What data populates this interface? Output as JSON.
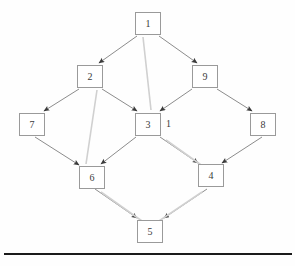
{
  "diagram": {
    "background_color": "#fefefe",
    "edge_color": "#8c8c8c",
    "edge_shadow_color": "#d0d0d0",
    "arrow_color": "#3a3a3a",
    "node_border_color": "#9a9a9a",
    "node_fill_color": "#ffffff",
    "text_color": "#3a3a3a",
    "rule_color": "#1a1a1a",
    "nodes": [
      {
        "id": "n1",
        "label": "1",
        "x": 135,
        "y": 12,
        "w": 26,
        "h": 23
      },
      {
        "id": "n2",
        "label": "2",
        "x": 77,
        "y": 65,
        "w": 26,
        "h": 23
      },
      {
        "id": "n9",
        "label": "9",
        "x": 192,
        "y": 65,
        "w": 26,
        "h": 23
      },
      {
        "id": "n7",
        "label": "7",
        "x": 19,
        "y": 113,
        "w": 26,
        "h": 23
      },
      {
        "id": "n3",
        "label": "3",
        "x": 135,
        "y": 113,
        "w": 26,
        "h": 23
      },
      {
        "id": "n8",
        "label": "8",
        "x": 250,
        "y": 113,
        "w": 26,
        "h": 23
      },
      {
        "id": "n6",
        "label": "6",
        "x": 79,
        "y": 166,
        "w": 26,
        "h": 23
      },
      {
        "id": "n4",
        "label": "4",
        "x": 198,
        "y": 164,
        "w": 26,
        "h": 23
      },
      {
        "id": "n5",
        "label": "5",
        "x": 137,
        "y": 220,
        "w": 26,
        "h": 23
      }
    ],
    "edge_labels": [
      {
        "id": "lbl-3-right",
        "text": "1",
        "x": 166,
        "y": 119
      }
    ],
    "edges": [
      {
        "id": "e-1-2",
        "from": "1",
        "to": "2",
        "x1": 137,
        "y1": 36,
        "x2": 99,
        "y2": 63,
        "arrow": true
      },
      {
        "id": "e-1-9",
        "from": "1",
        "to": "9",
        "x1": 159,
        "y1": 36,
        "x2": 197,
        "y2": 63,
        "arrow": true
      },
      {
        "id": "e-1-3",
        "from": "1",
        "to": "3",
        "x1": 143,
        "y1": 37,
        "x2": 151,
        "y2": 110,
        "arrow": false,
        "style": "shadow"
      },
      {
        "id": "e-2-7",
        "from": "2",
        "to": "7",
        "x1": 79,
        "y1": 89,
        "x2": 44,
        "y2": 111,
        "arrow": true
      },
      {
        "id": "e-2-3",
        "from": "2",
        "to": "3",
        "x1": 102,
        "y1": 89,
        "x2": 137,
        "y2": 111,
        "arrow": true
      },
      {
        "id": "e-2-6",
        "from": "2",
        "to": "6",
        "x1": 97,
        "y1": 90,
        "x2": 86,
        "y2": 164,
        "arrow": false,
        "style": "shadow"
      },
      {
        "id": "e-9-3",
        "from": "9",
        "to": "3",
        "x1": 192,
        "y1": 89,
        "x2": 160,
        "y2": 111,
        "arrow": true
      },
      {
        "id": "e-9-8",
        "from": "9",
        "to": "8",
        "x1": 217,
        "y1": 89,
        "x2": 252,
        "y2": 111,
        "arrow": true
      },
      {
        "id": "e-7-6",
        "from": "7",
        "to": "6",
        "x1": 35,
        "y1": 137,
        "x2": 79,
        "y2": 165,
        "arrow": true
      },
      {
        "id": "e-3-6",
        "from": "3",
        "to": "6",
        "x1": 136,
        "y1": 137,
        "x2": 101,
        "y2": 164,
        "arrow": true
      },
      {
        "id": "e-3-4",
        "from": "3",
        "to": "4",
        "x1": 160,
        "y1": 137,
        "x2": 198,
        "y2": 163,
        "arrow": true
      },
      {
        "id": "e-3-4-shadow",
        "from": "3",
        "to": "4",
        "x1": 166,
        "y1": 140,
        "x2": 204,
        "y2": 167,
        "arrow": false,
        "style": "shadow"
      },
      {
        "id": "e-8-4",
        "from": "8",
        "to": "4",
        "x1": 262,
        "y1": 137,
        "x2": 222,
        "y2": 163,
        "arrow": true
      },
      {
        "id": "e-6-5",
        "from": "6",
        "to": "5",
        "x1": 95,
        "y1": 189,
        "x2": 137,
        "y2": 218,
        "arrow": true
      },
      {
        "id": "e-6-5-shadow",
        "from": "6",
        "to": "5",
        "x1": 101,
        "y1": 192,
        "x2": 142,
        "y2": 221,
        "arrow": false,
        "style": "shadow"
      },
      {
        "id": "e-4-5",
        "from": "4",
        "to": "5",
        "x1": 207,
        "y1": 189,
        "x2": 164,
        "y2": 218,
        "arrow": true
      },
      {
        "id": "e-4-5-shadow",
        "from": "4",
        "to": "5",
        "x1": 202,
        "y1": 192,
        "x2": 159,
        "y2": 221,
        "arrow": false,
        "style": "shadow"
      }
    ],
    "baseline_rule": {
      "x": 4,
      "y": 253,
      "w": 288,
      "h": 2
    }
  }
}
